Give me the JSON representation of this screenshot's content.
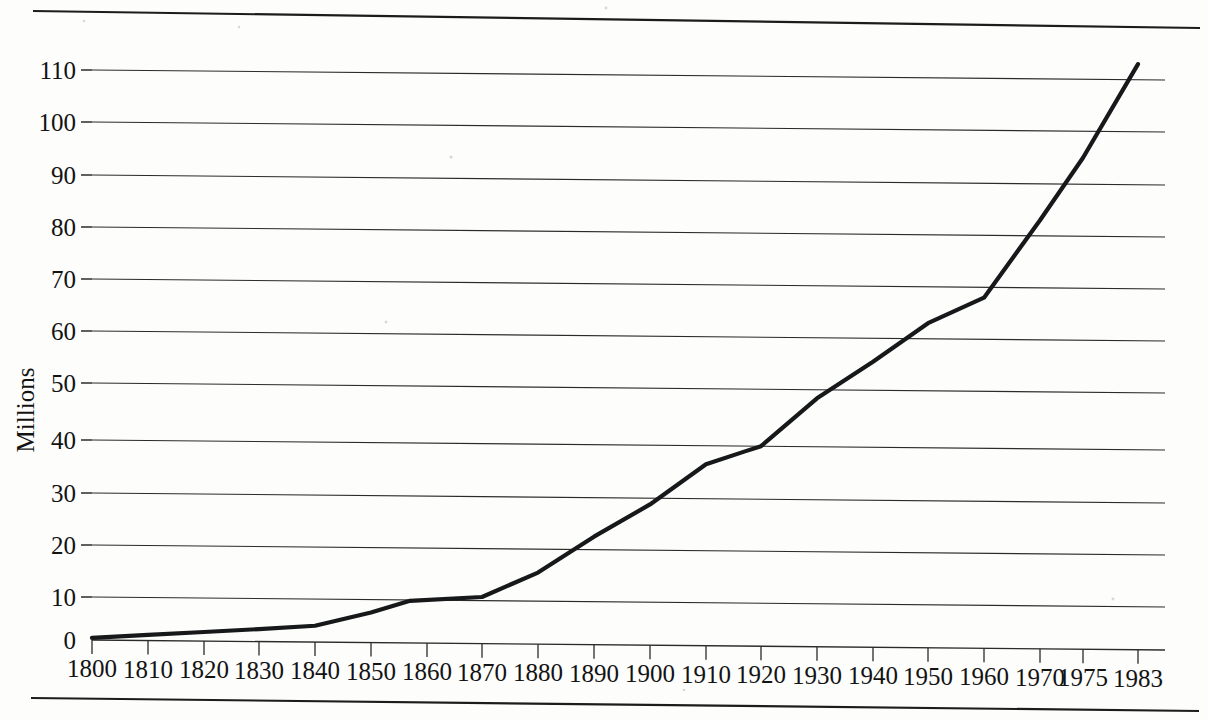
{
  "figure": {
    "name": "population-growth-line-chart",
    "top_rule": true,
    "bottom_rule": true
  },
  "chart_data": {
    "type": "line",
    "title": "",
    "xlabel": "",
    "ylabel": "Millions",
    "ylim": [
      0,
      118
    ],
    "xlim": [
      1800,
      1983
    ],
    "grid": true,
    "legend": "none",
    "y_ticks": [
      0,
      10,
      20,
      30,
      40,
      50,
      60,
      70,
      80,
      90,
      100,
      110
    ],
    "y_tick_labels": [
      "0",
      "10",
      "20",
      "30",
      "40",
      "50",
      "60",
      "70",
      "80",
      "90",
      "100",
      "110"
    ],
    "x_ticks": [
      1800,
      1810,
      1820,
      1830,
      1840,
      1850,
      1860,
      1870,
      1880,
      1890,
      1900,
      1910,
      1920,
      1930,
      1940,
      1950,
      1960,
      1970,
      1975,
      1983
    ],
    "x_tick_labels": [
      "1800",
      "1810",
      "1820",
      "1830",
      "1840",
      "1850",
      "1860",
      "1870",
      "1880",
      "1890",
      "1900",
      "1910",
      "1920",
      "1930",
      "1940",
      "1950",
      "1960",
      "1970",
      "1975",
      "1983"
    ],
    "series": [
      {
        "name": "population",
        "x": [
          1800,
          1810,
          1820,
          1830,
          1840,
          1850,
          1857,
          1870,
          1880,
          1890,
          1900,
          1910,
          1917,
          1920,
          1930,
          1940,
          1950,
          1960,
          1970,
          1975,
          1983
        ],
        "values": [
          0.5,
          1.3,
          2.1,
          2.9,
          3.8,
          7.0,
          9.8,
          10.7,
          15.5,
          22.5,
          28.8,
          36.5,
          39.0,
          40.0,
          48.5,
          55.5,
          63.0,
          68.0,
          83.0,
          95.0,
          113.0
        ]
      }
    ]
  },
  "geometry": {
    "plot_left": 92,
    "plot_right": 1165,
    "y_pixels": {
      "0": 640,
      "10": 597,
      "20": 545,
      "30": 493,
      "40": 440,
      "50": 383,
      "60": 331,
      "70": 279,
      "80": 227,
      "90": 175,
      "100": 122,
      "110": 70
    },
    "x_pixels": {
      "1800": 92,
      "1810": 148,
      "1820": 204,
      "1830": 259,
      "1840": 315,
      "1850": 371,
      "1857": 410,
      "1860": 427,
      "1870": 482,
      "1880": 538,
      "1890": 594,
      "1900": 650,
      "1910": 706,
      "1917": 745,
      "1920": 761,
      "1930": 817,
      "1940": 873,
      "1950": 928,
      "1960": 984,
      "1970": 1040,
      "1975": 1083,
      "1983": 1138
    }
  }
}
